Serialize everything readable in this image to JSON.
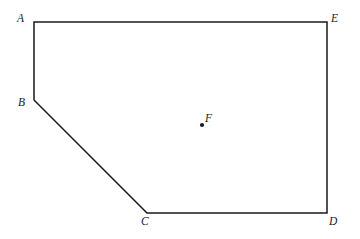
{
  "figure": {
    "background_color": "#ffffff",
    "stroke_color": "#1a1a1a",
    "stroke_width": 1.5,
    "width": 360,
    "height": 239,
    "labels": {
      "A": "A",
      "B": "B",
      "C": "C",
      "D": "D",
      "E": "E",
      "F": "F"
    },
    "points": {
      "A": {
        "x": 34,
        "y": 22
      },
      "B": {
        "x": 34,
        "y": 100
      },
      "C": {
        "x": 147,
        "y": 213
      },
      "D": {
        "x": 327,
        "y": 213
      },
      "E": {
        "x": 327,
        "y": 22
      },
      "F": {
        "x": 202,
        "y": 125
      }
    },
    "polygon_path": "M 34 22 L 327 22 L 327 213 L 147 213 L 34 100 Z",
    "interior_point": {
      "x": 202,
      "y": 125,
      "radius": 2.1,
      "fill": "#1a1a1a"
    },
    "edges": [
      {
        "name": "AE",
        "from": "A",
        "to": "E"
      },
      {
        "name": "ED",
        "from": "E",
        "to": "D"
      },
      {
        "name": "DC",
        "from": "D",
        "to": "C"
      },
      {
        "name": "CB",
        "from": "C",
        "to": "B"
      },
      {
        "name": "BA",
        "from": "B",
        "to": "A"
      }
    ]
  }
}
